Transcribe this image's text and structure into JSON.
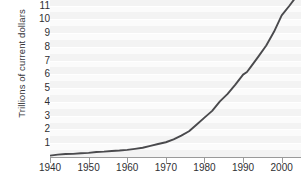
{
  "chart_data": {
    "type": "line",
    "title": "",
    "xlabel": "",
    "ylabel": "Trillions of current dollars",
    "xlim": [
      1940,
      2005
    ],
    "ylim": [
      0,
      11.4
    ],
    "grid": true,
    "legend": false,
    "legend_position": "none",
    "line_color": "#4a4a4d",
    "plot_background": "#f3f3f3",
    "band_color": "#fbfbfb",
    "axis_color": "#9a9a9a",
    "y_ticks": [
      1,
      2,
      3,
      4,
      5,
      6,
      7,
      8,
      9,
      10,
      11
    ],
    "y_tick_labels": [
      "1",
      "2",
      "3",
      "4",
      "5",
      "6",
      "7",
      "8",
      "9",
      "10",
      "11"
    ],
    "y_top_label_clipped": true,
    "x_ticks": [
      1940,
      1950,
      1960,
      1970,
      1980,
      1990,
      2000
    ],
    "x_tick_labels": [
      "1940",
      "1950",
      "1960",
      "1970",
      "1980",
      "1990",
      "2000"
    ],
    "series": [
      {
        "name": "Gross domestic product",
        "color": "#4a4a4d",
        "x": [
          1940,
          1942,
          1944,
          1946,
          1948,
          1950,
          1952,
          1954,
          1956,
          1958,
          1960,
          1962,
          1964,
          1966,
          1968,
          1970,
          1972,
          1974,
          1976,
          1978,
          1980,
          1982,
          1984,
          1986,
          1988,
          1990,
          1991,
          1992,
          1994,
          1996,
          1998,
          2000,
          2002,
          2004,
          2005
        ],
        "y": [
          0.1,
          0.17,
          0.22,
          0.23,
          0.27,
          0.3,
          0.36,
          0.39,
          0.44,
          0.47,
          0.52,
          0.59,
          0.67,
          0.81,
          0.94,
          1.07,
          1.28,
          1.55,
          1.87,
          2.36,
          2.86,
          3.35,
          4.04,
          4.58,
          5.25,
          5.98,
          6.17,
          6.54,
          7.31,
          8.1,
          9.09,
          10.28,
          10.98,
          11.73,
          12.1
        ],
        "annotations": []
      }
    ]
  }
}
